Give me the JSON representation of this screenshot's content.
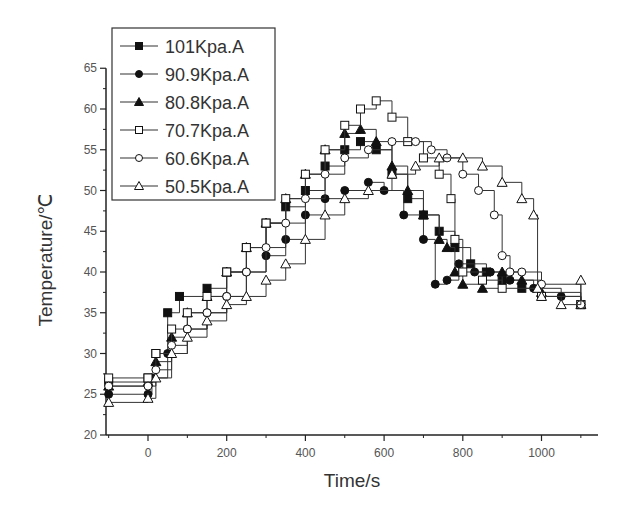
{
  "chart_data": {
    "type": "line",
    "title": "",
    "xlabel": "Time/s",
    "ylabel": "Temperature/℃",
    "xlim": [
      -107,
      1145
    ],
    "ylim": [
      20,
      65
    ],
    "x_ticks": [
      0,
      200,
      400,
      600,
      800,
      1000
    ],
    "y_ticks": [
      20,
      25,
      30,
      35,
      40,
      45,
      50,
      55,
      60,
      65
    ],
    "grid": false,
    "legend_position": "upper-left (boxed)",
    "series": [
      {
        "name": "101Kpa.A",
        "marker": "filled-square",
        "x": [
          -100,
          0,
          20,
          50,
          80,
          150,
          200,
          250,
          300,
          350,
          400,
          450,
          500,
          540,
          580,
          620,
          660,
          700,
          740,
          780,
          820,
          860,
          900,
          950,
          1000,
          1100
        ],
        "y": [
          26.5,
          27,
          30,
          35,
          37,
          38,
          40,
          43,
          46,
          48,
          50,
          53,
          55,
          56,
          55,
          52,
          49,
          47,
          45,
          43,
          41,
          40,
          39,
          38,
          37,
          36
        ]
      },
      {
        "name": "90.9Kpa.A",
        "marker": "filled-circle",
        "x": [
          -100,
          0,
          10,
          50,
          100,
          150,
          200,
          250,
          300,
          350,
          400,
          450,
          500,
          560,
          600,
          650,
          700,
          730,
          760,
          790,
          830,
          870,
          920,
          980,
          1050,
          1100
        ],
        "y": [
          25,
          25,
          27,
          30,
          33,
          35,
          37,
          40,
          42,
          44,
          47,
          49,
          50,
          51,
          50,
          47,
          44,
          38.5,
          39,
          41,
          40,
          40,
          39,
          38,
          37,
          36
        ]
      },
      {
        "name": "80.8Kpa.A",
        "marker": "filled-triangle",
        "x": [
          -100,
          0,
          20,
          60,
          100,
          150,
          200,
          250,
          300,
          350,
          400,
          450,
          500,
          540,
          580,
          620,
          660,
          700,
          740,
          760,
          780,
          800,
          850,
          900,
          950,
          1000,
          1100
        ],
        "y": [
          26,
          26.5,
          29,
          32,
          35,
          37,
          40,
          43,
          46,
          49,
          52,
          55,
          57,
          57.5,
          56,
          53,
          50,
          47,
          44,
          43,
          40,
          38.5,
          38,
          40,
          39,
          37.5,
          36
        ]
      },
      {
        "name": "70.7Kpa.A",
        "marker": "open-square",
        "x": [
          -100,
          0,
          20,
          60,
          100,
          150,
          200,
          250,
          300,
          350,
          400,
          450,
          500,
          540,
          580,
          620,
          660,
          700,
          740,
          770,
          780,
          800,
          850,
          900,
          1000,
          1100
        ],
        "y": [
          27,
          27,
          30,
          33,
          35,
          37,
          40,
          43,
          46,
          49,
          52,
          55,
          58,
          60,
          61,
          59,
          56,
          54,
          52,
          49,
          44,
          40,
          39,
          38,
          37,
          36
        ]
      },
      {
        "name": "60.6Kpa.A",
        "marker": "open-circle",
        "x": [
          -100,
          0,
          20,
          60,
          100,
          150,
          200,
          250,
          300,
          350,
          400,
          450,
          500,
          560,
          620,
          680,
          720,
          760,
          800,
          840,
          880,
          900,
          920,
          950,
          1000,
          1100
        ],
        "y": [
          26,
          26,
          28,
          31,
          33,
          35,
          37,
          40,
          43,
          46,
          49,
          52,
          54,
          55,
          56,
          56,
          55,
          54,
          52,
          50,
          47,
          42,
          40,
          40,
          38.5,
          36
        ]
      },
      {
        "name": "50.5Kpa.A",
        "marker": "open-triangle",
        "x": [
          -100,
          0,
          20,
          60,
          100,
          150,
          200,
          250,
          300,
          350,
          400,
          450,
          500,
          560,
          620,
          680,
          740,
          800,
          850,
          900,
          950,
          980,
          990,
          1000,
          1050,
          1100
        ],
        "y": [
          24,
          24.5,
          27,
          30,
          32,
          34,
          36,
          37,
          39,
          41,
          44,
          47,
          49,
          50,
          52,
          53,
          54,
          54,
          53,
          51,
          49,
          47,
          38,
          37,
          36,
          39
        ]
      }
    ]
  }
}
